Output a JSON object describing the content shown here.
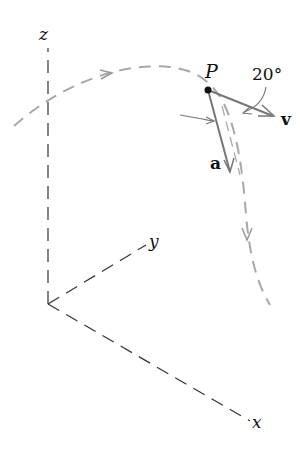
{
  "diagram": {
    "axes": {
      "x_label": "x",
      "y_label": "y",
      "z_label": "z"
    },
    "point_label": "P",
    "velocity_label": "v",
    "acceleration_label": "a",
    "angle_label": "20°",
    "colors": {
      "axes": "#333333",
      "path": "#a0a0a0",
      "vectors": "#888888",
      "text": "#111111"
    }
  }
}
